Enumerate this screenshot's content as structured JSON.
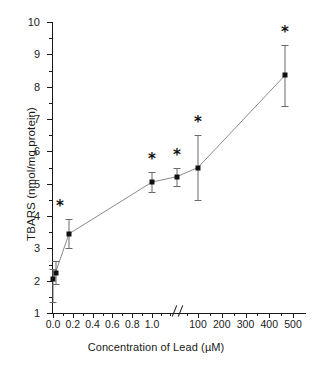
{
  "chart_data": {
    "type": "line",
    "title": "",
    "xlabel": "Concentration of Lead (µM)",
    "ylabel": "TBARS (nmol/mg protein)",
    "ylim": [
      1,
      10
    ],
    "grid": false,
    "legend": null,
    "axis_break": {
      "present": true,
      "symbol": "//",
      "between": [
        1.0,
        100
      ]
    },
    "y_ticks": [
      "1",
      "2",
      "3",
      "4",
      "5",
      "6",
      "7",
      "8",
      "9",
      "10"
    ],
    "x_ticks_left": [
      "0.0",
      "0.2",
      "0.4",
      "0.6",
      "0.8",
      "1.0"
    ],
    "x_ticks_right": [
      "100",
      "200",
      "300",
      "400",
      "500"
    ],
    "series": [
      {
        "name": "TBARS",
        "marker": "filled-square",
        "points": [
          {
            "x_label": "0.0",
            "y": 2.05,
            "err_low": 0.7,
            "err_high": 0.3,
            "significant": false
          },
          {
            "x_label": "0.01",
            "y": 2.25,
            "err_low": 0.35,
            "err_high": 0.35,
            "significant": false
          },
          {
            "x_label": "0.1",
            "y": 3.45,
            "err_low": 0.45,
            "err_high": 0.45,
            "significant": true
          },
          {
            "x_label": "1.0",
            "y": 5.05,
            "err_low": 0.3,
            "err_high": 0.3,
            "significant": true
          },
          {
            "x_label": "10",
            "y": 5.22,
            "err_low": 0.28,
            "err_high": 0.28,
            "significant": true
          },
          {
            "x_label": "100",
            "y": 5.5,
            "err_low": 1.0,
            "err_high": 1.0,
            "significant": true
          },
          {
            "x_label": "500",
            "y": 8.35,
            "err_low": 0.95,
            "err_high": 0.95,
            "significant": true
          }
        ]
      }
    ],
    "annotations": [
      {
        "text": "*",
        "near_point": "0.1"
      },
      {
        "text": "*",
        "near_point": "1.0"
      },
      {
        "text": "*",
        "near_point": "10"
      },
      {
        "text": "*",
        "near_point": "100"
      },
      {
        "text": "*",
        "near_point": "500"
      }
    ]
  },
  "colors": {
    "axis": "#1a1a1a",
    "marker": "#111111",
    "line": "#7d7d7d",
    "errorbar": "#6a6a6a",
    "background": "#ffffff"
  }
}
